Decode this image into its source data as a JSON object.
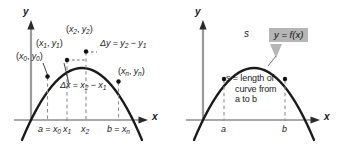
{
  "figure": {
    "type": "math-diagram",
    "background_color": "#ffffff",
    "curve_color": "#1a1a1a",
    "axis_color": "#8c8c8c",
    "dashed_color": "#8c8c8c",
    "callout_fill": "#b6b6b6"
  },
  "left_panel": {
    "name": "partition-diagram",
    "axes": {
      "y_label": "y",
      "x_label": "x"
    },
    "point_labels": [
      {
        "id": "p0",
        "text": "(x0, y0)",
        "x_sub": "0",
        "y_sub": "0"
      },
      {
        "id": "p1",
        "text": "(x1, y1)",
        "x_sub": "1",
        "y_sub": "1"
      },
      {
        "id": "p2",
        "text": "(x2, y2)",
        "x_sub": "2",
        "y_sub": "2"
      },
      {
        "id": "pn",
        "text": "(xn, yn)",
        "x_sub": "n",
        "y_sub": "n"
      }
    ],
    "delta_y_label": {
      "lhs": "Δy = y",
      "sub1": "2",
      "mid": " − y",
      "sub2": "1"
    },
    "delta_x_label": {
      "lhs": "Δx = x",
      "sub1": "2",
      "mid": " − x",
      "sub2": "1"
    },
    "x_ticks": [
      {
        "id": "tick-a",
        "text": "a = x",
        "sub": "0"
      },
      {
        "id": "tick-x1",
        "text": "x",
        "sub": "1"
      },
      {
        "id": "tick-x2",
        "text": "x",
        "sub": "2"
      },
      {
        "id": "tick-b",
        "text": "b = x",
        "sub": "n"
      }
    ]
  },
  "right_panel": {
    "name": "arc-length-diagram",
    "axes": {
      "y_label": "y",
      "x_label": "x"
    },
    "curve_callout": "y = f(x)",
    "arc_symbol": "s",
    "annotation": {
      "line1": "s = length of",
      "line2": "curve from",
      "line3": "a to b"
    },
    "x_ticks": [
      {
        "id": "tick-a",
        "text": "a"
      },
      {
        "id": "tick-b",
        "text": "b"
      }
    ]
  }
}
